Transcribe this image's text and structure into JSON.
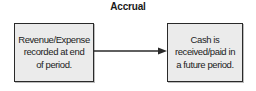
{
  "diagram": {
    "title": "Accrual",
    "nodes": [
      {
        "id": "left",
        "lines": [
          "Revenue/Expense",
          "recorded at end",
          "of period."
        ]
      },
      {
        "id": "right",
        "lines": [
          "Cash is",
          "received/paid in",
          "a future period."
        ]
      }
    ],
    "edges": [
      {
        "from": "left",
        "to": "right",
        "style": "solid-arrow"
      }
    ],
    "colors": {
      "box_fill": "#ebebeb",
      "box_border": "#2a2a2a",
      "arrow": "#2a2a2a",
      "text": "#222222"
    }
  }
}
